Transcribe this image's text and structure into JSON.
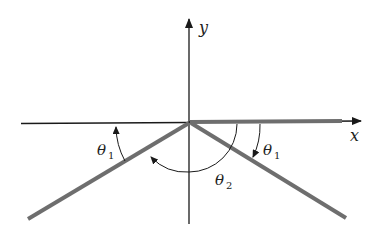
{
  "diagram": {
    "type": "geometry",
    "axes": {
      "x_label": "x",
      "y_label": "y"
    },
    "angles": [
      {
        "id": "theta1_left",
        "symbol": "θ",
        "subscript": "1"
      },
      {
        "id": "theta1_right",
        "symbol": "θ",
        "subscript": "1"
      },
      {
        "id": "theta2",
        "symbol": "θ",
        "subscript": "2"
      }
    ],
    "colors": {
      "axis": "#1a1a1a",
      "ray": "#6e6e6e",
      "background": "#ffffff"
    }
  }
}
